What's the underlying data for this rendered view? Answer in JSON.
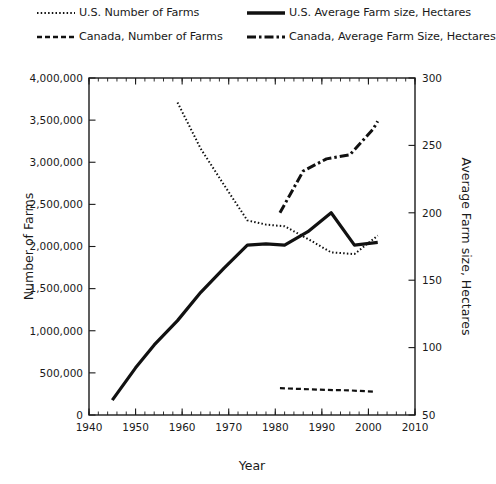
{
  "legend": {
    "items": [
      {
        "label": "U.S. Number of Farms",
        "style": "dotted",
        "name": "legend-us-number-of-farms"
      },
      {
        "label": "U.S. Average Farm size, Hectares",
        "style": "solid",
        "name": "legend-us-average-farm-size"
      },
      {
        "label": "Canada, Number of Farms",
        "style": "dashed",
        "name": "legend-canada-number-of-farms"
      },
      {
        "label": "Canada, Average Farm Size, Hectares",
        "style": "dashdot",
        "name": "legend-canada-average-farm-size"
      }
    ]
  },
  "chart_data": {
    "type": "line",
    "title": "",
    "xlabel": "Year",
    "ylabel": "Number of Farms",
    "y2label": "Average Farm size, Hectares",
    "xlim": [
      1940,
      2010
    ],
    "ylim": [
      0,
      4000000
    ],
    "y2lim": [
      50,
      300
    ],
    "xticks": [
      1940,
      1950,
      1960,
      1970,
      1980,
      1990,
      2000,
      2010
    ],
    "xticklabels": [
      "1940",
      "1950",
      "1960",
      "1970",
      "1980",
      "1990",
      "2000",
      "2010"
    ],
    "xminor_step": 2,
    "yticks": [
      0,
      500000,
      1000000,
      1500000,
      2000000,
      2500000,
      3000000,
      3500000,
      4000000
    ],
    "yticklabels": [
      "0",
      "500,000",
      "1,000,000",
      "1,500,000",
      "2,000,000",
      "2,500,000",
      "3,000,000",
      "3,500,000",
      "4,000,000"
    ],
    "y2ticks": [
      50,
      100,
      150,
      200,
      250,
      300
    ],
    "y2ticklabels": [
      "50",
      "100",
      "150",
      "200",
      "250",
      "300"
    ],
    "grid": false,
    "legend_position": "above",
    "series": [
      {
        "name": "U.S. Number of Farms",
        "axis": "left",
        "style": "dotted",
        "color": "#111111",
        "width": 2.0,
        "dasharray": "1.5,2.2",
        "x": [
          1959,
          1964,
          1969,
          1974,
          1978,
          1982,
          1987,
          1992,
          1997,
          2002
        ],
        "y": [
          3710000,
          3160000,
          2730000,
          2310000,
          2260000,
          2240000,
          2090000,
          1930000,
          1910000,
          2130000
        ]
      },
      {
        "name": "U.S. Average Farm size, Hectares",
        "axis": "right",
        "style": "solid",
        "color": "#111111",
        "width": 3.2,
        "dasharray": "none",
        "x": [
          1945,
          1950,
          1954,
          1959,
          1964,
          1969,
          1974,
          1978,
          1982,
          1987,
          1992,
          1997,
          2002
        ],
        "y": [
          61,
          85,
          102,
          120,
          141,
          159,
          176,
          177,
          176,
          186,
          200,
          176,
          178
        ]
      },
      {
        "name": "Canada, Number of Farms",
        "axis": "left",
        "style": "dashed",
        "color": "#111111",
        "width": 2.2,
        "dasharray": "5,3",
        "x": [
          1981,
          1986,
          1991,
          1996,
          2001
        ],
        "y": [
          318000,
          308000,
          298000,
          292000,
          277000
        ]
      },
      {
        "name": "Canada, Average Farm Size, Hectares",
        "axis": "right",
        "style": "dashdot",
        "color": "#111111",
        "width": 3.0,
        "dasharray": "9,3,2.5,3",
        "x": [
          1981,
          1986,
          1991,
          1996,
          2001,
          2002
        ],
        "y": [
          200,
          231,
          240,
          243,
          262,
          268
        ]
      }
    ]
  },
  "plot_geometry": {
    "left": 89,
    "right": 415,
    "top": 78,
    "bottom": 415
  }
}
